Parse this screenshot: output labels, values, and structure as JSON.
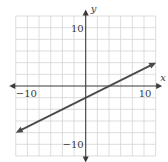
{
  "chart_data": {
    "type": "line",
    "title": "",
    "xlabel": "x",
    "ylabel": "y",
    "xlim": [
      -12,
      12
    ],
    "ylim": [
      -12,
      12
    ],
    "grid": true,
    "grid_step": 2,
    "tick_labels": {
      "x": [
        {
          "value": -10,
          "label": "−10"
        },
        {
          "value": 10,
          "label": "10"
        }
      ],
      "y": [
        {
          "value": 10,
          "label": "10"
        },
        {
          "value": -10,
          "label": "−10"
        }
      ]
    },
    "series": [
      {
        "name": "line",
        "equation": "y = 0.5x - 2",
        "slope": 0.5,
        "intercept": -2,
        "x": [
          -12,
          -10,
          -8,
          -6,
          -4,
          -2,
          0,
          2,
          4,
          6,
          8,
          10,
          12
        ],
        "values": [
          -8,
          -7,
          -6,
          -5,
          -4,
          -3,
          -2,
          -1,
          0,
          1,
          2,
          3,
          4
        ],
        "arrows_both_ends": true
      }
    ],
    "legend": null
  },
  "layout": {
    "origin_px": [
      85.7,
      86
    ],
    "px_per_unit": 5.83,
    "colors": {
      "grid": "#d4d4d4",
      "axis": "#3a3a3a",
      "line": "#4a4a4a"
    }
  }
}
